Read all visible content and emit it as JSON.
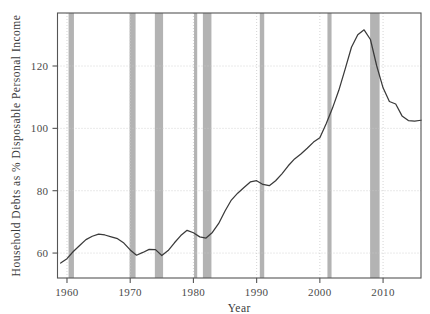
{
  "chart_data": {
    "type": "line",
    "title": "",
    "xlabel": "Year",
    "ylabel": "Household Debts as % Disposable Personal Income",
    "xlim": [
      1958.5,
      2016.0
    ],
    "ylim": [
      52.0,
      137.0
    ],
    "grid": true,
    "legend": null,
    "xticks": [
      1960,
      1970,
      1980,
      1990,
      2000,
      2010
    ],
    "xtick_labels": [
      "1960",
      "1970",
      "1980",
      "1990",
      "2000",
      "2010"
    ],
    "yticks": [
      60,
      80,
      100,
      120
    ],
    "ytick_labels": [
      "60",
      "80",
      "100",
      "120"
    ],
    "line_color": "#3a3a3a",
    "shading_color": "#b3b3b3",
    "grid_color": "#c9c9c9",
    "axis_color": "#555555",
    "series": [
      {
        "name": "Household Debt to Disposable Personal Income",
        "x": [
          1959,
          1960,
          1961,
          1962,
          1963,
          1964,
          1965,
          1966,
          1967,
          1968,
          1969,
          1970,
          1971,
          1972,
          1973,
          1974,
          1975,
          1976,
          1977,
          1978,
          1979,
          1980,
          1981,
          1982,
          1983,
          1984,
          1985,
          1986,
          1987,
          1988,
          1989,
          1990,
          1991,
          1992,
          1993,
          1994,
          1995,
          1996,
          1997,
          1998,
          1999,
          2000,
          2001,
          2002,
          2003,
          2004,
          2005,
          2006,
          2007,
          2008,
          2009,
          2010,
          2011,
          2012,
          2013,
          2014,
          2015,
          2016
        ],
        "y": [
          56.8,
          58.2,
          60.5,
          62.4,
          64.3,
          65.4,
          66.1,
          65.8,
          65.2,
          64.6,
          63.2,
          61.0,
          59.3,
          60.2,
          61.2,
          61.1,
          59.2,
          60.8,
          63.3,
          65.6,
          67.3,
          66.5,
          65.2,
          64.8,
          66.6,
          69.5,
          73.5,
          77.0,
          79.2,
          81.0,
          82.8,
          83.2,
          82.0,
          81.6,
          83.2,
          85.4,
          88.0,
          90.2,
          91.8,
          93.6,
          95.6,
          97.0,
          101.5,
          106.5,
          112.2,
          119.0,
          126.0,
          130.0,
          131.6,
          128.5,
          120.0,
          113.0,
          108.6,
          107.8,
          104.0,
          102.5,
          102.3,
          102.6
        ],
        "units": "percent"
      }
    ],
    "recession_bands": [
      {
        "label": "1960-61 recession",
        "start": 1960.25,
        "end": 1961.1
      },
      {
        "label": "1969-70 recession",
        "start": 1969.9,
        "end": 1970.85
      },
      {
        "label": "1973-75 recession",
        "start": 1973.9,
        "end": 1975.2
      },
      {
        "label": "1980 recession",
        "start": 1980.1,
        "end": 1980.6
      },
      {
        "label": "1981-82 recession",
        "start": 1981.5,
        "end": 1982.85
      },
      {
        "label": "1990-91 recession",
        "start": 1990.5,
        "end": 1991.2
      },
      {
        "label": "2001 recession",
        "start": 2001.2,
        "end": 2001.85
      },
      {
        "label": "2007-09 recession",
        "start": 2007.95,
        "end": 2009.45
      }
    ]
  }
}
